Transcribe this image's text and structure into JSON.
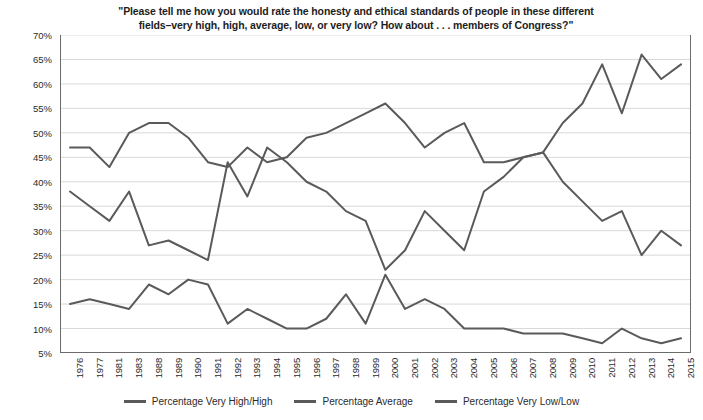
{
  "chart_data": {
    "type": "line",
    "title": "\"Please tell me how you would rate the honesty and ethical standards of people in these different fields–very high, high, average, low, or very low? How about . . . members of Congress?\"",
    "title_line1": "\"Please tell me how you would rate the honesty and ethical standards of people in these different",
    "title_line2": "fields–very high, high, average, low, or very low? How about . . . members of Congress?\"",
    "xlabel": "",
    "ylabel": "",
    "ylim": [
      5,
      70
    ],
    "ytick_step": 5,
    "grid": true,
    "legend_position": "bottom",
    "line_color": "#5a5a5a",
    "grid_color": "#d9d9d9",
    "axis_color": "#6b6b6b",
    "categories": [
      "1976",
      "1977",
      "1981",
      "1983",
      "1988",
      "1989",
      "1990",
      "1991",
      "1992",
      "1993",
      "1994",
      "1995",
      "1996",
      "1997",
      "1998",
      "1999",
      "2000",
      "2001",
      "2002",
      "2003",
      "2004",
      "2005",
      "2006",
      "2007",
      "2008",
      "2009",
      "2010",
      "2011",
      "2012",
      "2013",
      "2014",
      "2015"
    ],
    "ytick_labels": [
      "70%",
      "65%",
      "60%",
      "55%",
      "50%",
      "45%",
      "40%",
      "35%",
      "30%",
      "25%",
      "20%",
      "15%",
      "10%",
      "5%"
    ],
    "ytick_values": [
      70,
      65,
      60,
      55,
      50,
      45,
      40,
      35,
      30,
      25,
      20,
      15,
      10,
      5
    ],
    "series": [
      {
        "name": "Percentage Very High/High",
        "values": [
          15,
          16,
          15,
          14,
          19,
          17,
          20,
          19,
          11,
          14,
          12,
          10,
          10,
          12,
          17,
          11,
          21,
          14,
          16,
          14,
          10,
          10,
          10,
          9,
          9,
          9,
          8,
          7,
          10,
          8,
          7,
          8
        ]
      },
      {
        "name": "Percentage Average",
        "values": [
          38,
          35,
          32,
          38,
          27,
          28,
          26,
          24,
          44,
          37,
          47,
          44,
          40,
          38,
          34,
          32,
          22,
          26,
          34,
          30,
          26,
          38,
          41,
          45,
          46,
          40,
          36,
          32,
          34,
          25,
          30,
          27
        ]
      },
      {
        "name": "Percentage Very Low/Low",
        "values": [
          47,
          47,
          43,
          50,
          52,
          52,
          49,
          44,
          43,
          47,
          44,
          45,
          49,
          50,
          52,
          54,
          56,
          52,
          47,
          50,
          52,
          44,
          44,
          45,
          46,
          52,
          56,
          64,
          54,
          66,
          61,
          64
        ]
      }
    ]
  }
}
